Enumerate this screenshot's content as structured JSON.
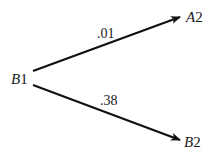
{
  "diagram": {
    "type": "tree",
    "nodes": {
      "root": {
        "letter": "B",
        "number": "1"
      },
      "upper": {
        "letter": "A",
        "number": "2"
      },
      "lower": {
        "letter": "B",
        "number": "2"
      }
    },
    "edges": [
      {
        "from": "B1",
        "to": "A2",
        "label": ".01"
      },
      {
        "from": "B1",
        "to": "B2",
        "label": ".38"
      }
    ],
    "colors": {
      "line": "#111111",
      "text": "#1a1a1a",
      "background": "#ffffff"
    }
  }
}
